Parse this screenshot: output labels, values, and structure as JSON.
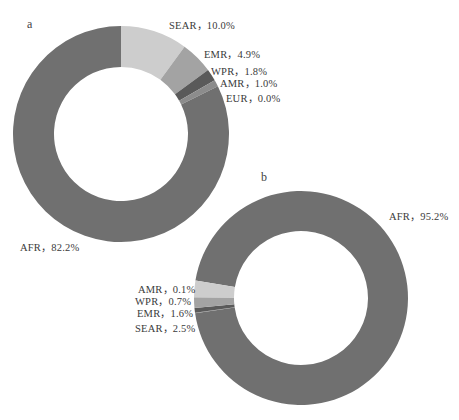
{
  "chart_data": [
    {
      "type": "pie",
      "subtype": "donut",
      "panel": "a",
      "categories": [
        "SEAR",
        "EMR",
        "WPR",
        "AMR",
        "EUR",
        "AFR"
      ],
      "values": [
        10.0,
        4.9,
        1.8,
        1.0,
        0.0,
        82.2
      ],
      "labels": [
        "SEAR，10.0%",
        "EMR，4.9%",
        "WPR，1.8%",
        "AMR，1.0%",
        "EUR，0.0%",
        "AFR，82.2%"
      ],
      "colors": [
        "#cdcdcd",
        "#a3a3a3",
        "#5a5a5a",
        "#8c8c8c",
        "#9a9a9a",
        "#707070"
      ],
      "start_angle_deg": 0,
      "direction": "clockwise"
    },
    {
      "type": "pie",
      "subtype": "donut",
      "panel": "b",
      "categories": [
        "AFR",
        "AMR",
        "WPR",
        "EMR",
        "SEAR"
      ],
      "values": [
        95.2,
        0.1,
        0.7,
        1.6,
        2.5
      ],
      "labels": [
        "AFR，95.2%",
        "AMR，0.1%",
        "WPR，0.7%",
        "EMR，1.6%",
        "SEAR，2.5%"
      ],
      "colors": [
        "#707070",
        "#8c8c8c",
        "#5a5a5a",
        "#a3a3a3",
        "#cdcdcd"
      ],
      "start_angle_deg": 279.4,
      "direction": "clockwise"
    }
  ],
  "panels": {
    "a": {
      "letter": "a",
      "labels": {
        "sear": "SEAR，10.0%",
        "emr": "EMR，4.9%",
        "wpr": "WPR，1.8%",
        "amr": "AMR，1.0%",
        "eur": "EUR，0.0%",
        "afr": "AFR，82.2%"
      }
    },
    "b": {
      "letter": "b",
      "labels": {
        "afr": "AFR，95.2%",
        "amr": "AMR，0.1%",
        "wpr": "WPR，0.7%",
        "emr": "EMR，1.6%",
        "sear": "SEAR，2.5%"
      }
    }
  }
}
